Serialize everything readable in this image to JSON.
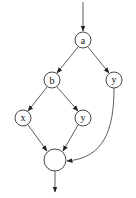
{
  "diagram": {
    "type": "directed-graph",
    "nodes": [
      {
        "id": "a",
        "label": "a",
        "cx": 83,
        "cy": 40,
        "r": 8
      },
      {
        "id": "b",
        "label": "b",
        "cx": 52,
        "cy": 80,
        "r": 8
      },
      {
        "id": "y1",
        "label": "y",
        "cx": 114,
        "cy": 80,
        "r": 8
      },
      {
        "id": "x",
        "label": "x",
        "cx": 23,
        "cy": 118,
        "r": 8
      },
      {
        "id": "y2",
        "label": "y",
        "cx": 83,
        "cy": 118,
        "r": 8
      },
      {
        "id": "join",
        "label": "",
        "cx": 55,
        "cy": 160,
        "r": 11
      }
    ],
    "edges": [
      {
        "from": "entry",
        "to": "a"
      },
      {
        "from": "a",
        "to": "b"
      },
      {
        "from": "a",
        "to": "y1"
      },
      {
        "from": "b",
        "to": "x"
      },
      {
        "from": "b",
        "to": "y2"
      },
      {
        "from": "x",
        "to": "join"
      },
      {
        "from": "y2",
        "to": "join"
      },
      {
        "from": "y1",
        "to": "join"
      },
      {
        "from": "join",
        "to": "exit"
      }
    ]
  }
}
